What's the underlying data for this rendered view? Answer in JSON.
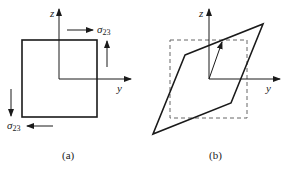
{
  "panels": [
    {
      "id": "a",
      "caption": "(a)",
      "axes": {
        "z_label": "z",
        "y_label": "y"
      },
      "stress_label": "σ",
      "stress_subscript": "23",
      "shape": "square",
      "description": "Square element under pure shear stress σ23"
    },
    {
      "id": "b",
      "caption": "(b)",
      "axes": {
        "z_label": "z",
        "y_label": "y"
      },
      "shape": "parallelogram",
      "reference_shape": "dashed square",
      "description": "Deformed element (sheared parallelogram) over original dashed square"
    }
  ],
  "colors": {
    "line": "#1a1a1a",
    "dashed": "#666666",
    "background": "#ffffff"
  }
}
